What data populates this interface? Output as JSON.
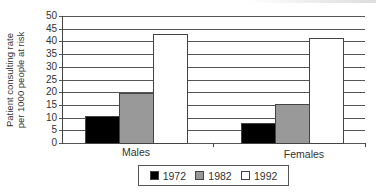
{
  "chart_data": {
    "type": "bar",
    "title": "",
    "xlabel": "",
    "ylabel": "Patient consulting rate per 1000 people at risk",
    "ylabel_lines": [
      "Patient consulting rate",
      "per 1000 people at risk"
    ],
    "categories": [
      "Males",
      "Females"
    ],
    "series": [
      {
        "name": "1972",
        "color": "#000000",
        "values": [
          10.5,
          8
        ]
      },
      {
        "name": "1982",
        "color": "#999999",
        "values": [
          19.5,
          15.5
        ]
      },
      {
        "name": "1992",
        "color": "#ffffff",
        "values": [
          43,
          41.5
        ]
      }
    ],
    "ylim": [
      0,
      50
    ],
    "yticks": [
      0,
      5,
      10,
      15,
      20,
      25,
      30,
      35,
      40,
      45,
      50
    ],
    "grid": true,
    "legend_position": "bottom"
  },
  "legend": {
    "items": [
      {
        "label": "1972",
        "color": "#000000"
      },
      {
        "label": "1982",
        "color": "#999999"
      },
      {
        "label": "1992",
        "color": "#ffffff"
      }
    ]
  }
}
